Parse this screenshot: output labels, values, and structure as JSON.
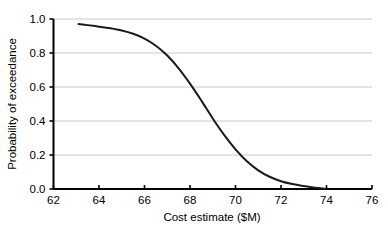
{
  "chart_data": {
    "type": "line",
    "title": "",
    "xlabel": "Cost estimate ($M)",
    "ylabel": "Probability of exceedance",
    "xlim": [
      62,
      76
    ],
    "ylim": [
      0.0,
      1.0
    ],
    "xticks": [
      62,
      64,
      66,
      68,
      70,
      72,
      74,
      76
    ],
    "xtick_labels": [
      "62",
      "64",
      "66",
      "68",
      "70",
      "72",
      "74",
      "76"
    ],
    "yticks": [
      0.0,
      0.2,
      0.4,
      0.6,
      0.8,
      1.0
    ],
    "ytick_labels": [
      "0.0",
      "0.2",
      "0.4",
      "0.6",
      "0.8",
      "1.0"
    ],
    "grid": "horizontal",
    "grid_color": "#c8c8c8",
    "legend": "none",
    "background_color": "#ffffff",
    "axis_color": "#000000",
    "series": [
      {
        "name": "Exceedance curve",
        "color": "#1a1a1a",
        "line_width": 2,
        "x": [
          63.1,
          63.5,
          64.0,
          64.5,
          65.0,
          65.5,
          66.0,
          66.5,
          67.0,
          67.5,
          68.0,
          68.5,
          69.0,
          69.5,
          70.0,
          70.5,
          71.0,
          71.5,
          72.0,
          72.5,
          73.0,
          73.5,
          73.9
        ],
        "y": [
          0.97,
          0.964,
          0.955,
          0.945,
          0.932,
          0.913,
          0.885,
          0.843,
          0.785,
          0.71,
          0.62,
          0.52,
          0.415,
          0.318,
          0.233,
          0.163,
          0.11,
          0.072,
          0.046,
          0.029,
          0.017,
          0.007,
          0.002
        ]
      }
    ]
  },
  "axes": {
    "x_axis_name": "x-axis",
    "y_axis_name": "y-axis"
  }
}
